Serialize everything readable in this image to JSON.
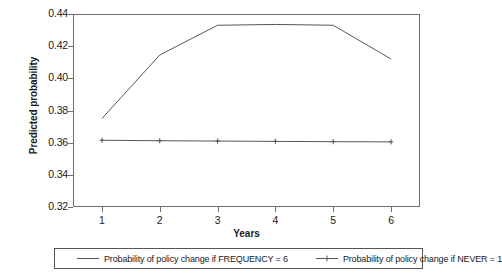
{
  "chart_data": {
    "type": "line",
    "title": "",
    "subtitle": "",
    "xlabel": "Years",
    "ylabel": "Predicted probability",
    "x": [
      1,
      2,
      3,
      4,
      5,
      6
    ],
    "categories": [
      "1",
      "2",
      "3",
      "4",
      "5",
      "6"
    ],
    "xlim": [
      0.5,
      6.5
    ],
    "ylim": [
      0.32,
      0.44
    ],
    "y_ticks": [
      "0.32",
      "0.34",
      "0.36",
      "0.38",
      "0.40",
      "0.42",
      "0.44"
    ],
    "y_tick_values": [
      0.32,
      0.34,
      0.36,
      0.38,
      0.4,
      0.42,
      0.44
    ],
    "grid": false,
    "legend_position": "bottom",
    "series": [
      {
        "name": "Probability of policy change if FREQUENCY = 6",
        "values": [
          0.375,
          0.4145,
          0.433,
          0.4335,
          0.433,
          0.412
        ],
        "marker": "none",
        "color": "#555555"
      },
      {
        "name": "Probability of policy change if NEVER = 1",
        "values": [
          0.3615,
          0.3612,
          0.361,
          0.3608,
          0.3606,
          0.3605
        ],
        "marker": "plus",
        "color": "#555555"
      }
    ]
  },
  "axes": {
    "y_title": "Predicted probability",
    "x_title": "Years"
  },
  "legend": {
    "entries": [
      {
        "label": "Probability of policy change if FREQUENCY = 6",
        "marker": "line"
      },
      {
        "label": "Probability of policy change if NEVER = 1",
        "marker": "line-plus"
      }
    ]
  }
}
